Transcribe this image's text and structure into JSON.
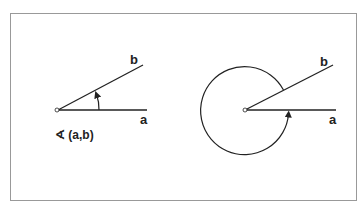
{
  "diagram": {
    "left": {
      "ray_a_label": "a",
      "ray_b_label": "b",
      "caption": "∢ (a,b)"
    },
    "right": {
      "ray_a_label": "a",
      "ray_b_label": "b"
    },
    "colors": {
      "stroke": "#222222",
      "frame": "#999999"
    }
  }
}
